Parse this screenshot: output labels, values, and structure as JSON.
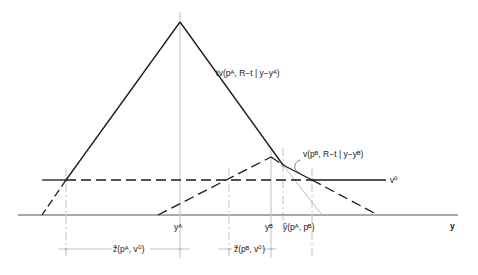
{
  "diagram": {
    "axis_label": "y",
    "v0_label": "v⁰",
    "curve_A_label": "ℓv(pᴬ, R−t | y−yᴬ)",
    "curve_B_label": "v(pᴮ, R−t | y−yᴮ)",
    "tick_labels": {
      "yA": "yᴬ",
      "yB": "yᴮ",
      "yhat": "ŷ(pᴬ, pᴮ)"
    },
    "interval_labels": {
      "zA": "z̃(pᴬ, v⁰)",
      "zB": "z̃(pᴮ, v⁰)"
    },
    "colors": {
      "ink": "#1a1a1a",
      "guide": "#9a9a9a",
      "background": "#ffffff"
    }
  }
}
